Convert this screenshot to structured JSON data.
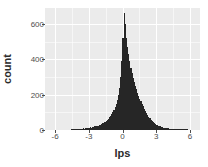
{
  "chart_data": {
    "type": "bar",
    "subtype": "histogram",
    "title": "",
    "xlabel": "lps",
    "ylabel": "count",
    "xlim": [
      -6.9,
      6.9
    ],
    "ylim": [
      0,
      690
    ],
    "xticks": [
      -6,
      -3,
      0,
      3,
      6
    ],
    "xtick_labels": [
      "-6",
      "-3",
      "0",
      "3",
      "6"
    ],
    "yticks": [
      0,
      200,
      400,
      600
    ],
    "ytick_labels": [
      "0",
      "200",
      "400",
      "600"
    ],
    "grid": true,
    "legend": "none",
    "panel_background": "#ebebeb",
    "grid_color": "#ffffff",
    "bar_color": "#262626",
    "binwidth": 0.1,
    "bin_centers": [
      -4.55,
      -4.45,
      -4.35,
      -4.25,
      -4.15,
      -4.05,
      -3.95,
      -3.85,
      -3.75,
      -3.65,
      -3.55,
      -3.45,
      -3.35,
      -3.25,
      -3.15,
      -3.05,
      -2.95,
      -2.85,
      -2.75,
      -2.65,
      -2.55,
      -2.45,
      -2.35,
      -2.25,
      -2.15,
      -2.05,
      -1.95,
      -1.85,
      -1.75,
      -1.65,
      -1.55,
      -1.45,
      -1.35,
      -1.25,
      -1.15,
      -1.05,
      -0.95,
      -0.85,
      -0.75,
      -0.65,
      -0.55,
      -0.45,
      -0.35,
      -0.25,
      -0.15,
      -0.05,
      0.05,
      0.15,
      0.25,
      0.35,
      0.45,
      0.55,
      0.65,
      0.75,
      0.85,
      0.95,
      1.05,
      1.15,
      1.25,
      1.35,
      1.45,
      1.55,
      1.65,
      1.75,
      1.85,
      1.95,
      2.05,
      2.15,
      2.25,
      2.35,
      2.45,
      2.55,
      2.65,
      2.75,
      2.85,
      2.95,
      3.05,
      3.15,
      3.25,
      3.35,
      3.45,
      3.55,
      3.65,
      3.75,
      3.85,
      3.95,
      4.05,
      4.15,
      4.25,
      4.35,
      4.45,
      4.55,
      4.65,
      4.75,
      4.85,
      4.95,
      5.05,
      5.15,
      5.25,
      5.35,
      5.45,
      5.55,
      5.65,
      5.75
    ],
    "counts": [
      3,
      2,
      4,
      3,
      5,
      4,
      6,
      5,
      7,
      6,
      8,
      9,
      8,
      11,
      10,
      13,
      12,
      15,
      14,
      18,
      17,
      21,
      20,
      25,
      24,
      29,
      31,
      34,
      38,
      42,
      47,
      52,
      58,
      64,
      71,
      80,
      89,
      100,
      112,
      128,
      146,
      170,
      200,
      240,
      300,
      390,
      520,
      660,
      600,
      520,
      470,
      430,
      390,
      350,
      320,
      295,
      270,
      250,
      230,
      212,
      195,
      178,
      162,
      148,
      134,
      120,
      108,
      96,
      85,
      75,
      66,
      58,
      51,
      45,
      39,
      34,
      30,
      26,
      23,
      20,
      18,
      16,
      14,
      12,
      11,
      10,
      9,
      8,
      7,
      6,
      6,
      5,
      5,
      4,
      4,
      3,
      3,
      3,
      2,
      2,
      2,
      2,
      1,
      1
    ]
  },
  "axis": {
    "x_title": "lps",
    "y_title": "count"
  }
}
